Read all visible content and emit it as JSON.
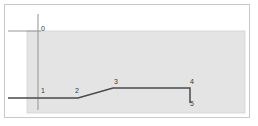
{
  "diagram": {
    "type": "profile-section",
    "frame": {
      "border_color": "#c9c9c9",
      "background_color": "#ffffff"
    },
    "shaded_region": {
      "fill_color": "#e4e4e4",
      "edge_color": "#d2d2d2",
      "x": 27,
      "y": 31,
      "width": 218,
      "height": 82
    },
    "reference_line": {
      "name": "vertical-axis-line",
      "color": "#9a9a9a",
      "x": 38,
      "y_top": 14,
      "y_bottom": 110
    },
    "datum_line": {
      "name": "datum-tick-line",
      "color": "#8c8c8c",
      "y": 31,
      "x_start": 8,
      "x_end": 41
    },
    "profile_line": {
      "name": "profile-polyline",
      "color": "#4a4a4a",
      "stroke_width": 1.4,
      "points": [
        {
          "x": 8,
          "y": 98
        },
        {
          "x": 78,
          "y": 98
        },
        {
          "x": 113,
          "y": 88
        },
        {
          "x": 190,
          "y": 88
        },
        {
          "x": 190,
          "y": 103
        }
      ]
    },
    "labels": [
      {
        "id": "0",
        "text": "0",
        "x": 41,
        "y": 25,
        "anchor": "left"
      },
      {
        "id": "1",
        "text": "1",
        "x": 41,
        "y": 87,
        "anchor": "left"
      },
      {
        "id": "2",
        "text": "2",
        "x": 75,
        "y": 87,
        "anchor": "left"
      },
      {
        "id": "3",
        "text": "3",
        "x": 114,
        "y": 78,
        "anchor": "left"
      },
      {
        "id": "4",
        "text": "4",
        "x": 190,
        "y": 78,
        "anchor": "left"
      },
      {
        "id": "5",
        "text": "5",
        "x": 190,
        "y": 100,
        "anchor": "left"
      }
    ]
  }
}
